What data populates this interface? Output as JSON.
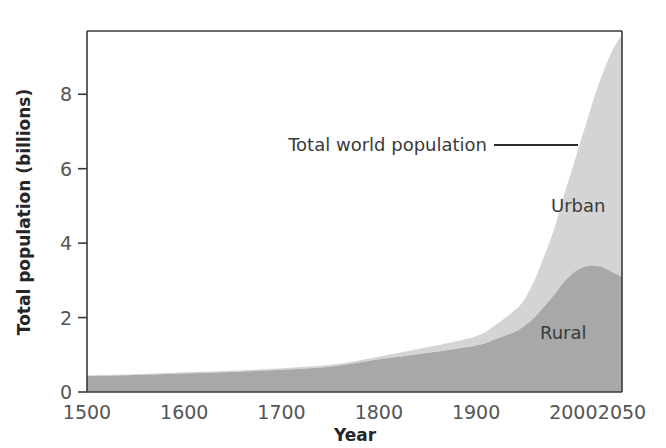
{
  "chart_data": {
    "type": "area",
    "title": "",
    "subtitle": "",
    "xlabel": "Year",
    "ylabel": "Total population (billions)",
    "stacked": true,
    "grid": false,
    "legend_position": "inline-annotations",
    "xlim": [
      1500,
      2050
    ],
    "ylim": [
      0,
      9.7
    ],
    "xticks": [
      1500,
      1600,
      1700,
      1800,
      1900,
      2000,
      2050
    ],
    "xtick_labels": [
      "1500",
      "1600",
      "1700",
      "1800",
      "1900",
      "2000",
      "2050"
    ],
    "yticks": [
      0,
      2,
      4,
      6,
      8
    ],
    "ytick_labels": [
      "0",
      "2",
      "4",
      "6",
      "8"
    ],
    "x": [
      1500,
      1550,
      1600,
      1650,
      1700,
      1750,
      1800,
      1850,
      1900,
      1920,
      1940,
      1950,
      1960,
      1970,
      1980,
      1990,
      2000,
      2010,
      2020,
      2030,
      2040,
      2050
    ],
    "series": [
      {
        "name": "Rural",
        "color": "#a8a8a8",
        "values": [
          0.43,
          0.46,
          0.5,
          0.54,
          0.6,
          0.68,
          0.88,
          1.05,
          1.25,
          1.42,
          1.62,
          1.78,
          2.0,
          2.3,
          2.6,
          2.95,
          3.2,
          3.35,
          3.4,
          3.35,
          3.22,
          3.1
        ]
      },
      {
        "name": "Urban",
        "color": "#d4d4d4",
        "values": [
          0.02,
          0.02,
          0.03,
          0.03,
          0.04,
          0.05,
          0.07,
          0.15,
          0.25,
          0.38,
          0.58,
          0.72,
          1.0,
          1.35,
          1.75,
          2.3,
          2.9,
          3.6,
          4.4,
          5.2,
          5.95,
          6.5
        ]
      }
    ],
    "totals": [
      0.45,
      0.48,
      0.53,
      0.57,
      0.64,
      0.73,
      0.95,
      1.2,
      1.5,
      1.8,
      2.2,
      2.5,
      3.0,
      3.65,
      4.35,
      5.25,
      6.1,
      6.95,
      7.8,
      8.55,
      9.17,
      9.6
    ],
    "annotations": [
      {
        "text": "Total world population",
        "points_to_series": "total",
        "at_year": 2010
      },
      {
        "text": "Urban",
        "series": "Urban"
      },
      {
        "text": "Rural",
        "series": "Rural"
      }
    ],
    "colors": {
      "urban": "#d4d4d4",
      "rural": "#a8a8a8",
      "axis": "#3a3a3a",
      "tick_text": "#555555",
      "title_text": "#262626",
      "background": "#ffffff"
    }
  },
  "axes": {
    "y_axis_title": "Total population (billions)",
    "x_axis_title": "Year"
  },
  "labels": {
    "urban": "Urban",
    "rural": "Rural",
    "total_annotation": "Total world population"
  },
  "ytick_labels": [
    "0",
    "2",
    "4",
    "6",
    "8"
  ],
  "xtick_labels": [
    "1500",
    "1600",
    "1700",
    "1800",
    "1900",
    "2000",
    "2050"
  ]
}
